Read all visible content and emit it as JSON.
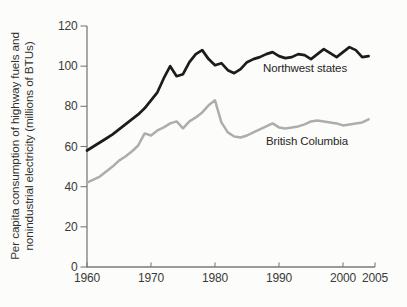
{
  "chart_data": {
    "type": "line",
    "title": "",
    "xlabel": "",
    "ylabel": "Per capita consumption of highway fuels and nonindustrial electricity (millions of BTUs)",
    "ylabel_lines": [
      "Per capita consumption of highway fuels and",
      "nonindustrial electricity (millions of BTUs)"
    ],
    "xlim": [
      1960,
      2005
    ],
    "ylim": [
      0,
      120
    ],
    "x_ticks": [
      1960,
      1970,
      1980,
      1990,
      2000,
      2005
    ],
    "y_ticks": [
      0,
      20,
      40,
      60,
      80,
      100,
      120
    ],
    "grid": false,
    "legend_position": "inline-labels-on-plot",
    "axis_color": "#7a7a7a",
    "text_color": "#3a3a3a",
    "background_color": "#fcfcfa",
    "x": [
      1960,
      1961,
      1962,
      1963,
      1964,
      1965,
      1966,
      1967,
      1968,
      1969,
      1970,
      1971,
      1972,
      1973,
      1974,
      1975,
      1976,
      1977,
      1978,
      1979,
      1980,
      1981,
      1982,
      1983,
      1984,
      1985,
      1986,
      1987,
      1988,
      1989,
      1990,
      1991,
      1992,
      1993,
      1994,
      1995,
      1996,
      1997,
      1998,
      1999,
      2000,
      2001,
      2002,
      2003,
      2004
    ],
    "series": [
      {
        "name": "Northwest states",
        "color": "#1c1c1c",
        "values": [
          58,
          60,
          62,
          64,
          66,
          68.5,
          71,
          73.5,
          76,
          79,
          83,
          87,
          94,
          100,
          95,
          96,
          102,
          106,
          108,
          103.5,
          100.5,
          101.5,
          98,
          96.5,
          98.5,
          102,
          103.5,
          104.5,
          106,
          107,
          105,
          104,
          104.5,
          106,
          105.5,
          103.5,
          106,
          108.5,
          106.5,
          104.5,
          107,
          109.5,
          108,
          104.5,
          105
        ]
      },
      {
        "name": "British Columbia",
        "color": "#adadad",
        "values": [
          42,
          43.5,
          45,
          47.5,
          50,
          53,
          55,
          57.5,
          60.5,
          66.5,
          65.5,
          68,
          69.5,
          71.5,
          72.5,
          69,
          72.5,
          74.5,
          77,
          80.5,
          83,
          72,
          67,
          65,
          64.5,
          65.5,
          67,
          68.5,
          70,
          71.5,
          69.5,
          69,
          69.5,
          70,
          71,
          72.5,
          73,
          72.5,
          72,
          71.5,
          70.5,
          71,
          71.5,
          72,
          73.5
        ]
      }
    ]
  }
}
